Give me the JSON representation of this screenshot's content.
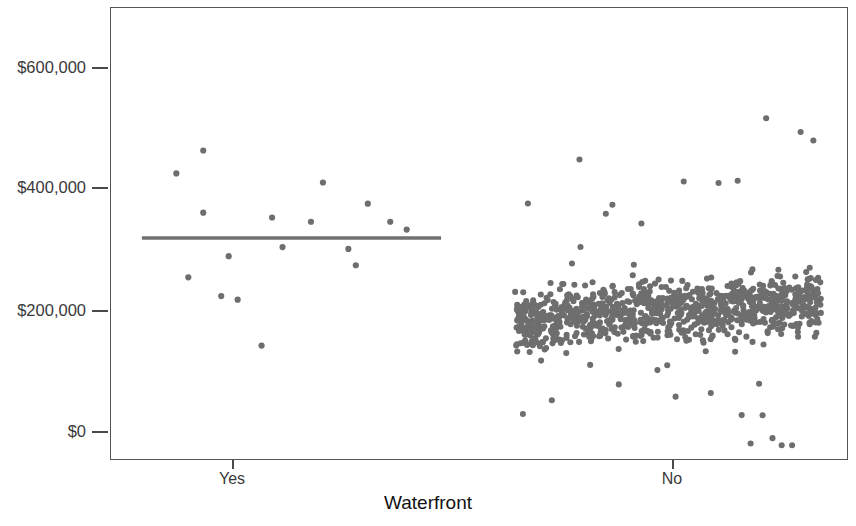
{
  "chart_data": {
    "type": "scatter",
    "title": "",
    "xlabel": "Waterfront",
    "ylabel": "Home Price",
    "categories": [
      "Yes",
      "No"
    ],
    "ytick_labels": [
      "$600,000",
      "$400,000",
      "$200,000",
      "$0"
    ],
    "ytick_values": [
      600000,
      400000,
      200000,
      0
    ],
    "ylim": [
      -60000,
      690000
    ],
    "grid": false,
    "legend": null,
    "point_color": "#6e6e6e",
    "meanline_color": "#707070",
    "axis_color": "#555555",
    "annotations": [
      {
        "label": "group mean line (Yes)",
        "y_value": 318000,
        "x_category": "Yes"
      }
    ],
    "series": [
      {
        "name": "Yes",
        "category": "Yes",
        "n": 17,
        "points": [
          {
            "jitter": 0.115,
            "value": 425000
          },
          {
            "jitter": 0.205,
            "value": 463000
          },
          {
            "jitter": 0.205,
            "value": 360000
          },
          {
            "jitter": 0.155,
            "value": 253000
          },
          {
            "jitter": 0.265,
            "value": 222000
          },
          {
            "jitter": 0.29,
            "value": 288000
          },
          {
            "jitter": 0.32,
            "value": 216000
          },
          {
            "jitter": 0.4,
            "value": 140000
          },
          {
            "jitter": 0.435,
            "value": 352000
          },
          {
            "jitter": 0.47,
            "value": 303000
          },
          {
            "jitter": 0.565,
            "value": 345000
          },
          {
            "jitter": 0.605,
            "value": 410000
          },
          {
            "jitter": 0.69,
            "value": 300000
          },
          {
            "jitter": 0.715,
            "value": 273000
          },
          {
            "jitter": 0.755,
            "value": 375000
          },
          {
            "jitter": 0.83,
            "value": 345000
          },
          {
            "jitter": 0.885,
            "value": 332000
          }
        ]
      },
      {
        "name": "No",
        "category": "No",
        "n": 980,
        "center_value": 196000,
        "spread_value": 42000,
        "min_value": -25000,
        "max_value": 658000,
        "note": "dense jittered strip; bulk between $110,000 and $270,000"
      }
    ]
  },
  "axes": {
    "x_ticks": [
      {
        "label": "Yes",
        "x_px": 232
      },
      {
        "label": "No",
        "x_px": 672
      }
    ],
    "y_ticks": [
      {
        "label": "$600,000",
        "y_px": 67
      },
      {
        "label": "$400,000",
        "y_px": 187
      },
      {
        "label": "$200,000",
        "y_px": 310
      },
      {
        "label": "$0",
        "y_px": 431
      }
    ]
  }
}
